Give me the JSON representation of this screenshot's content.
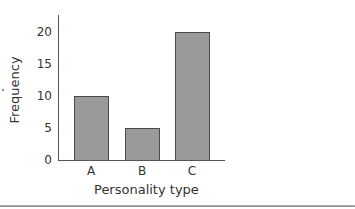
{
  "chart_data": {
    "type": "bar",
    "title": "",
    "xlabel": "Personality type",
    "ylabel": "Frequency",
    "categories": [
      "A",
      "B",
      "C"
    ],
    "values": [
      10,
      5,
      20
    ],
    "ylim": [
      0,
      22
    ],
    "yticks": [
      "0",
      "5",
      "10",
      "15",
      "20"
    ],
    "grid": false,
    "legend": null,
    "bar_color": "#9a9a9a",
    "bar_edge_color": "#4a4a4a"
  }
}
